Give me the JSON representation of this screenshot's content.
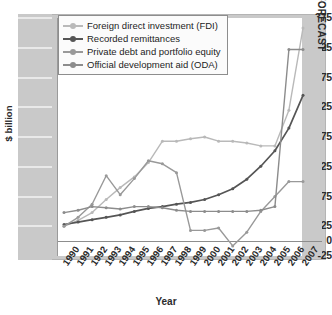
{
  "chart_data": {
    "type": "line",
    "title": "",
    "xlabel": "Year",
    "ylabel": "$ billion",
    "ylim": [
      -25,
      375
    ],
    "yticks": [
      375,
      325,
      275,
      225,
      175,
      125,
      75,
      25,
      0,
      -25
    ],
    "ytick_labels": [
      "375",
      "325",
      "275",
      "225",
      "175",
      "125",
      "75",
      "25",
      "0",
      "-25"
    ],
    "grid": false,
    "legend_position": "top-left",
    "categories": [
      "1990",
      "1991",
      "1992",
      "1993",
      "1994",
      "1995",
      "1996",
      "1997",
      "1998",
      "1999",
      "2000",
      "2001",
      "2002",
      "2003",
      "2004",
      "2005",
      "2006",
      "2007"
    ],
    "x": [
      1990,
      1991,
      1992,
      1993,
      1994,
      1995,
      1996,
      1997,
      1998,
      1999,
      2000,
      2001,
      2002,
      2003,
      2004,
      2005,
      2006,
      2007
    ],
    "series": [
      {
        "name": "Foreign direct investment (FDI)",
        "color": "#b9b9b9",
        "values": [
          25,
          35,
          48,
          70,
          90,
          108,
          132,
          168,
          168,
          172,
          175,
          168,
          168,
          165,
          160,
          160,
          220,
          358
        ]
      },
      {
        "name": "Recorded remittances",
        "color": "#555555",
        "values": [
          28,
          32,
          36,
          40,
          44,
          50,
          55,
          58,
          62,
          65,
          70,
          78,
          88,
          104,
          126,
          152,
          190,
          245
        ]
      },
      {
        "name": "Private debt and portfolio equity",
        "color": "#999999",
        "values": [
          25,
          40,
          62,
          110,
          78,
          105,
          135,
          130,
          115,
          18,
          18,
          22,
          -8,
          15,
          50,
          75,
          100,
          100
        ]
      },
      {
        "name": "Official development aid (ODA)",
        "color": "#8c8c8c",
        "values": [
          48,
          52,
          58,
          56,
          54,
          58,
          58,
          56,
          52,
          50,
          50,
          50,
          50,
          50,
          52,
          58,
          322,
          322
        ]
      }
    ],
    "annotations": [
      {
        "text": "FORECAST",
        "type": "band-label",
        "x_start": 2006.5,
        "x_end": 2007.5
      }
    ]
  },
  "legend": {
    "items": [
      {
        "label": "Foreign direct investment (FDI)"
      },
      {
        "label": "Recorded remittances"
      },
      {
        "label": "Private debt and portfolio equity"
      },
      {
        "label": "Official development aid (ODA)"
      }
    ]
  },
  "axes": {
    "y_title": "$ billion",
    "x_title": "Year"
  },
  "forecast": {
    "label": "FORECAST"
  }
}
